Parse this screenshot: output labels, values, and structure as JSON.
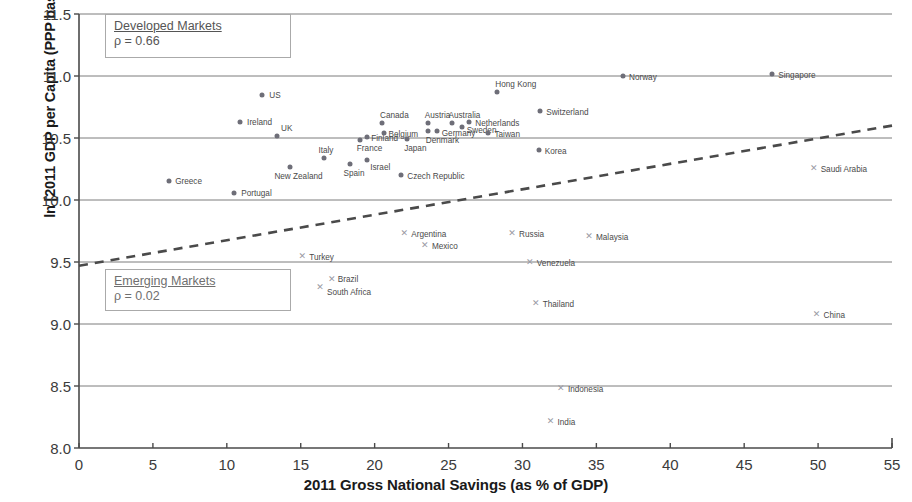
{
  "chart_data": {
    "type": "scatter",
    "title": "",
    "xlabel": "2011 Gross National Savings (as % of GDP)",
    "ylabel": "ln [2011 GDP per Capita (PPP basis, Current Intl $)]",
    "xlim": [
      0,
      55
    ],
    "ylim": [
      8.0,
      11.5
    ],
    "xticks": [
      0,
      5,
      10,
      15,
      20,
      25,
      30,
      35,
      40,
      45,
      50,
      55
    ],
    "xticklabels": [
      "0",
      "5",
      "10",
      "15",
      "20",
      "25",
      "30",
      "35",
      "40",
      "45",
      "50",
      "55"
    ],
    "yticks": [
      8.0,
      8.5,
      9.0,
      9.5,
      10.0,
      10.5,
      11.0,
      11.5
    ],
    "yticklabels": [
      "8.0",
      "8.5",
      "9.0",
      "9.5",
      "10.0",
      "10.5",
      "11.0",
      "11.5"
    ],
    "grid": "horizontal",
    "legend_position": "none",
    "annotations": [
      {
        "name": "developed-markets",
        "title": "Developed Markets",
        "rho_label": "ρ = 0.66",
        "rho": 0.66
      },
      {
        "name": "emerging-markets",
        "title": "Emerging Markets",
        "rho_label": "ρ = 0.02",
        "rho": 0.02
      }
    ],
    "trendline": {
      "name": "emerging-markets-fit",
      "style": "dashed",
      "color": "#4a4a4a",
      "x0": 0.0,
      "y0": 9.47,
      "x1": 55.0,
      "y1": 10.6
    },
    "series": [
      {
        "name": "Developed Markets",
        "marker": "dot",
        "color": "#6e6e78",
        "points": [
          {
            "label": "US",
            "x": 12.4,
            "y": 10.85,
            "lx": 7,
            "ly": -4
          },
          {
            "label": "Ireland",
            "x": 10.9,
            "y": 10.63,
            "lx": 7,
            "ly": -4
          },
          {
            "label": "UK",
            "x": 13.4,
            "y": 10.52,
            "lx": 4,
            "ly": -12
          },
          {
            "label": "Greece",
            "x": 6.1,
            "y": 10.15,
            "lx": 6,
            "ly": -4
          },
          {
            "label": "Portugal",
            "x": 10.5,
            "y": 10.06,
            "lx": 7,
            "ly": -4
          },
          {
            "label": "New Zealand",
            "x": 14.3,
            "y": 10.27,
            "lx": -16,
            "ly": 5
          },
          {
            "label": "Italy",
            "x": 16.6,
            "y": 10.34,
            "lx": -6,
            "ly": -12
          },
          {
            "label": "Spain",
            "x": 18.3,
            "y": 10.29,
            "lx": -6,
            "ly": 5
          },
          {
            "label": "Israel",
            "x": 19.5,
            "y": 10.32,
            "lx": 3,
            "ly": 3
          },
          {
            "label": "France",
            "x": 19.0,
            "y": 10.48,
            "lx": -3,
            "ly": 4
          },
          {
            "label": "Finland",
            "x": 19.5,
            "y": 10.51,
            "lx": 4,
            "ly": -3
          },
          {
            "label": "Belgium",
            "x": 20.6,
            "y": 10.54,
            "lx": 5,
            "ly": -3
          },
          {
            "label": "Canada",
            "x": 20.5,
            "y": 10.62,
            "lx": -2,
            "ly": -12
          },
          {
            "label": "Czech Republic",
            "x": 21.8,
            "y": 10.2,
            "lx": 6,
            "ly": -3
          },
          {
            "label": "Japan",
            "x": 22.2,
            "y": 10.49,
            "lx": -3,
            "ly": 5
          },
          {
            "label": "Denmark",
            "x": 23.6,
            "y": 10.56,
            "lx": -2,
            "ly": 5
          },
          {
            "label": "Austria",
            "x": 23.6,
            "y": 10.62,
            "lx": -3,
            "ly": -12
          },
          {
            "label": "Germany",
            "x": 24.2,
            "y": 10.56,
            "lx": 5,
            "ly": -2
          },
          {
            "label": "Australia",
            "x": 25.2,
            "y": 10.62,
            "lx": -3,
            "ly": -12
          },
          {
            "label": "Sweden",
            "x": 25.9,
            "y": 10.59,
            "lx": 5,
            "ly": -1
          },
          {
            "label": "Netherlands",
            "x": 26.4,
            "y": 10.63,
            "lx": 6,
            "ly": -3
          },
          {
            "label": "Taiwan",
            "x": 27.7,
            "y": 10.54,
            "lx": 6,
            "ly": -3
          },
          {
            "label": "Hong Kong",
            "x": 28.3,
            "y": 10.87,
            "lx": -2,
            "ly": -12
          },
          {
            "label": "Korea",
            "x": 31.1,
            "y": 10.4,
            "lx": 6,
            "ly": -3
          },
          {
            "label": "Switzerland",
            "x": 31.2,
            "y": 10.72,
            "lx": 6,
            "ly": -3
          },
          {
            "label": "Norway",
            "x": 36.8,
            "y": 11.0,
            "lx": 6,
            "ly": -3
          },
          {
            "label": "Singapore",
            "x": 46.9,
            "y": 11.02,
            "lx": 6,
            "ly": -3
          }
        ]
      },
      {
        "name": "Emerging Markets",
        "marker": "x",
        "color": "#9a9aa4",
        "points": [
          {
            "label": "Turkey",
            "x": 15.1,
            "y": 9.55,
            "lx": 7,
            "ly": -3
          },
          {
            "label": "South Africa",
            "x": 16.3,
            "y": 9.3,
            "lx": 7,
            "ly": 1
          },
          {
            "label": "Brazil",
            "x": 17.1,
            "y": 9.36,
            "lx": 6,
            "ly": -4
          },
          {
            "label": "Argentina",
            "x": 22.0,
            "y": 9.73,
            "lx": 7,
            "ly": -3
          },
          {
            "label": "Mexico",
            "x": 23.4,
            "y": 9.64,
            "lx": 7,
            "ly": -3
          },
          {
            "label": "Russia",
            "x": 29.3,
            "y": 9.73,
            "lx": 7,
            "ly": -3
          },
          {
            "label": "Venezuela",
            "x": 30.5,
            "y": 9.5,
            "lx": 7,
            "ly": -3
          },
          {
            "label": "Thailand",
            "x": 30.9,
            "y": 9.17,
            "lx": 7,
            "ly": -3
          },
          {
            "label": "Malaysia",
            "x": 34.5,
            "y": 9.71,
            "lx": 7,
            "ly": -3
          },
          {
            "label": "Indonesia",
            "x": 32.6,
            "y": 8.48,
            "lx": 7,
            "ly": -3
          },
          {
            "label": "India",
            "x": 31.9,
            "y": 8.22,
            "lx": 7,
            "ly": -3
          },
          {
            "label": "China",
            "x": 49.9,
            "y": 9.08,
            "lx": 7,
            "ly": -3
          },
          {
            "label": "Saudi Arabia",
            "x": 49.7,
            "y": 10.26,
            "lx": 7,
            "ly": -3
          }
        ]
      }
    ]
  }
}
